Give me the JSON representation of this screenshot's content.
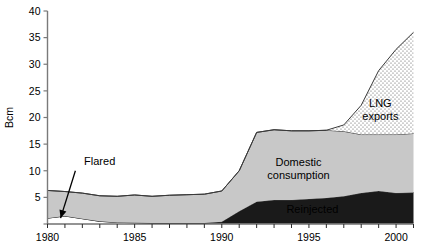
{
  "chart_data": {
    "type": "area",
    "stacked": true,
    "title": "",
    "xlabel": "",
    "ylabel": "Bcm",
    "xlim": [
      1980,
      2001
    ],
    "ylim": [
      0,
      40
    ],
    "yticks": [
      0,
      5,
      10,
      15,
      20,
      25,
      30,
      35,
      40
    ],
    "ytick_labels": [
      "",
      "5",
      "10",
      "15",
      "20",
      "25",
      "30",
      "35",
      "40"
    ],
    "xticks": [
      1980,
      1981,
      1982,
      1983,
      1984,
      1985,
      1986,
      1987,
      1988,
      1989,
      1990,
      1991,
      1992,
      1993,
      1994,
      1995,
      1996,
      1997,
      1998,
      1999,
      2000,
      2001
    ],
    "xtick_labels": [
      "1980",
      "",
      "",
      "",
      "",
      "1985",
      "",
      "",
      "",
      "",
      "1990",
      "",
      "",
      "",
      "",
      "1995",
      "",
      "",
      "",
      "",
      "2000",
      ""
    ],
    "grid": false,
    "legend_position": "inline-annotations",
    "x": [
      1980,
      1981,
      1982,
      1983,
      1984,
      1985,
      1986,
      1987,
      1988,
      1989,
      1990,
      1991,
      1992,
      1993,
      1994,
      1995,
      1996,
      1997,
      1998,
      1999,
      2000,
      2001
    ],
    "series": [
      {
        "name": "Flared",
        "label": "Flared",
        "fill": "#ffffff",
        "pattern": "solid-white",
        "values": [
          1.1,
          1.5,
          1.0,
          0.5,
          0.3,
          0.25,
          0.2,
          0.2,
          0.2,
          0.2,
          0.2,
          0.2,
          0.2,
          0.2,
          0.2,
          0.2,
          0.2,
          0.2,
          0.2,
          0.2,
          0.2,
          0.2
        ]
      },
      {
        "name": "Reinjected",
        "label": "Reinjected",
        "fill": "#1a1a1a",
        "pattern": "solid-black",
        "values": [
          0.0,
          0.0,
          0.0,
          0.0,
          0.0,
          0.0,
          0.0,
          0.0,
          0.0,
          0.0,
          0.2,
          2.2,
          4.0,
          4.3,
          4.3,
          4.5,
          4.7,
          5.0,
          5.6,
          6.0,
          5.6,
          5.7
        ]
      },
      {
        "name": "Domestic consumption",
        "label": "Domestic consumption",
        "fill": "#c8c8c8",
        "pattern": "solid-gray",
        "values": [
          5.2,
          4.6,
          4.8,
          4.8,
          4.9,
          5.2,
          5.0,
          5.2,
          5.3,
          5.4,
          5.8,
          7.6,
          13.0,
          13.2,
          13.0,
          12.8,
          12.7,
          12.2,
          11.0,
          10.6,
          11.0,
          11.1
        ]
      },
      {
        "name": "LNG exports",
        "label": "LNG exports",
        "fill": "#ffffff",
        "pattern": "dotted",
        "values": [
          0.0,
          0.0,
          0.0,
          0.0,
          0.0,
          0.0,
          0.0,
          0.0,
          0.0,
          0.0,
          0.0,
          0.0,
          0.0,
          0.0,
          0.0,
          0.0,
          0.0,
          1.2,
          5.5,
          12.0,
          16.0,
          19.0
        ]
      }
    ],
    "annotations": [
      {
        "name": "flared-annotation",
        "text": "Flared",
        "text_x": 1982.1,
        "text_y": 11.0,
        "arrow_from_x": 1981.6,
        "arrow_from_y": 10.0,
        "arrow_to_x": 1980.75,
        "arrow_to_y": 1.1
      }
    ],
    "inline_labels": [
      {
        "name": "domestic-consumption-label",
        "text_lines": [
          "Domestic",
          "consumption"
        ],
        "x": 1994.4,
        "y": 10.8,
        "color": "#000000"
      },
      {
        "name": "reinjected-label",
        "text_lines": [
          "Reinjected"
        ],
        "x": 1995.2,
        "y": 2.1,
        "color": "#ffffff"
      },
      {
        "name": "lng-exports-label",
        "text_lines": [
          "LNG",
          "exports"
        ],
        "x": 1999.1,
        "y": 22.0,
        "color": "#000000"
      }
    ]
  }
}
